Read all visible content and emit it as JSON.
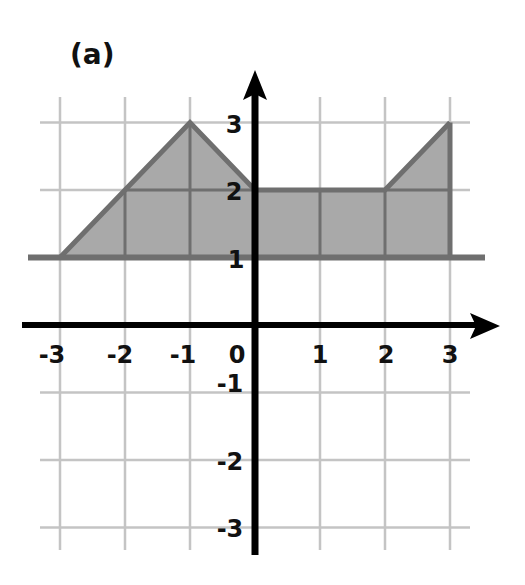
{
  "panel_label": "(a)",
  "chart_data": {
    "type": "area",
    "title": "(a)",
    "xlabel": "",
    "ylabel": "",
    "xlim": [
      -3,
      3
    ],
    "ylim": [
      -3,
      3
    ],
    "grid": true,
    "x_ticks": [
      -3,
      -2,
      -1,
      0,
      1,
      2,
      3
    ],
    "x_tick_labels": [
      "-3",
      "-2",
      "-1",
      "0",
      "1",
      "2",
      "3"
    ],
    "y_ticks": [
      3,
      2,
      1,
      -1,
      -2,
      -3
    ],
    "y_tick_labels": [
      "3",
      "2",
      "1",
      "-1",
      "-2",
      "-3"
    ],
    "series": [
      {
        "name": "upper boundary",
        "x": [
          -3,
          -2,
          -1,
          0,
          1,
          2,
          3
        ],
        "y": [
          1,
          2,
          3,
          2,
          2,
          2,
          3
        ]
      },
      {
        "name": "lower boundary",
        "x": [
          -3,
          3
        ],
        "y": [
          1,
          1
        ]
      }
    ],
    "shaded_region": "area between upper boundary and the line y = 1, for x from -3 to 3",
    "colors": {
      "fill": "#a9a9a9",
      "boundary": "#6f6f6f",
      "grid": "#c4c4c4",
      "axis": "#000000"
    }
  }
}
